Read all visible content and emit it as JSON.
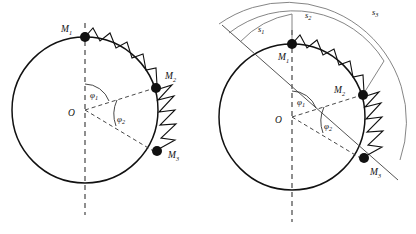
{
  "figure": {
    "background_color": "#ffffff",
    "stroke_color": "#111111",
    "dashed_color": "#333333",
    "arc_measure_color": "#777777",
    "width": 416,
    "height": 234
  },
  "panels": [
    {
      "id": "left",
      "name": "undeformed-configuration",
      "center_label": "O",
      "masses": [
        {
          "name": "mass-m1",
          "base": "M",
          "sub": "1"
        },
        {
          "name": "mass-m2",
          "base": "M",
          "sub": "2"
        },
        {
          "name": "mass-m3",
          "base": "M",
          "sub": "3"
        }
      ],
      "angles": [
        {
          "name": "angle-phi1",
          "base": "φ",
          "sub": "1"
        },
        {
          "name": "angle-phi2",
          "base": "φ",
          "sub": "2"
        }
      ],
      "springs": [
        {
          "name": "spring-m1-m2",
          "coils": 8
        },
        {
          "name": "spring-m2-m3",
          "coils": 6
        }
      ]
    },
    {
      "id": "right",
      "name": "arc-length-configuration",
      "center_label": "O",
      "masses": [
        {
          "name": "mass-m1",
          "base": "M",
          "sub": "1"
        },
        {
          "name": "mass-m2",
          "base": "M",
          "sub": "2"
        },
        {
          "name": "mass-m3",
          "base": "M",
          "sub": "3"
        }
      ],
      "angles": [
        {
          "name": "angle-phi1",
          "base": "φ",
          "sub": "1"
        },
        {
          "name": "angle-phi2",
          "base": "φ",
          "sub": "2"
        }
      ],
      "springs": [
        {
          "name": "spring-m1-m2",
          "coils": 8
        },
        {
          "name": "spring-m2-m3",
          "coils": 6
        }
      ],
      "arc_measures": [
        {
          "name": "arc-measure-s1",
          "base": "s",
          "sub": "1"
        },
        {
          "name": "arc-measure-s2",
          "base": "s",
          "sub": "2"
        },
        {
          "name": "arc-measure-s3",
          "base": "s",
          "sub": "3"
        }
      ]
    }
  ]
}
